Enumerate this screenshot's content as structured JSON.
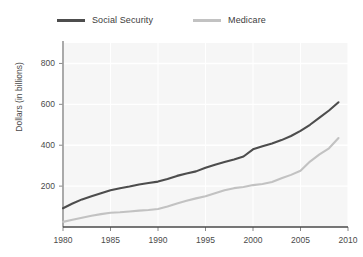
{
  "chart_data": {
    "type": "line",
    "title": "",
    "xlabel": "",
    "ylabel": "Dollars (in billions)",
    "xlim": [
      1980,
      2010
    ],
    "ylim": [
      0,
      900
    ],
    "grid": true,
    "legend_position": "top",
    "yticks": [
      200,
      400,
      600,
      800
    ],
    "ytick_labels": [
      "200",
      "400",
      "600",
      "800"
    ],
    "xticks": [
      1980,
      1985,
      1990,
      1995,
      2000,
      2005,
      2010
    ],
    "xtick_labels": [
      "1980",
      "1985",
      "1990",
      "1995",
      "2000",
      "2005",
      "2010"
    ],
    "x": [
      1980,
      1981,
      1982,
      1983,
      1984,
      1985,
      1986,
      1987,
      1988,
      1989,
      1990,
      1991,
      1992,
      1993,
      1994,
      1995,
      1996,
      1997,
      1998,
      1999,
      2000,
      2001,
      2002,
      2003,
      2004,
      2005,
      2006,
      2007,
      2008,
      2009
    ],
    "series": [
      {
        "name": "Social Security",
        "color": "#4d4d4d",
        "values": [
          92,
          115,
          135,
          150,
          165,
          180,
          190,
          198,
          208,
          215,
          222,
          235,
          250,
          262,
          272,
          290,
          305,
          318,
          330,
          345,
          380,
          395,
          408,
          425,
          445,
          470,
          500,
          535,
          570,
          610
        ]
      },
      {
        "name": "Medicare",
        "color": "#c2c2c2",
        "values": [
          25,
          35,
          45,
          55,
          63,
          70,
          72,
          76,
          80,
          83,
          88,
          100,
          115,
          128,
          140,
          150,
          165,
          180,
          190,
          196,
          205,
          210,
          220,
          238,
          255,
          275,
          320,
          355,
          385,
          435
        ]
      }
    ]
  }
}
